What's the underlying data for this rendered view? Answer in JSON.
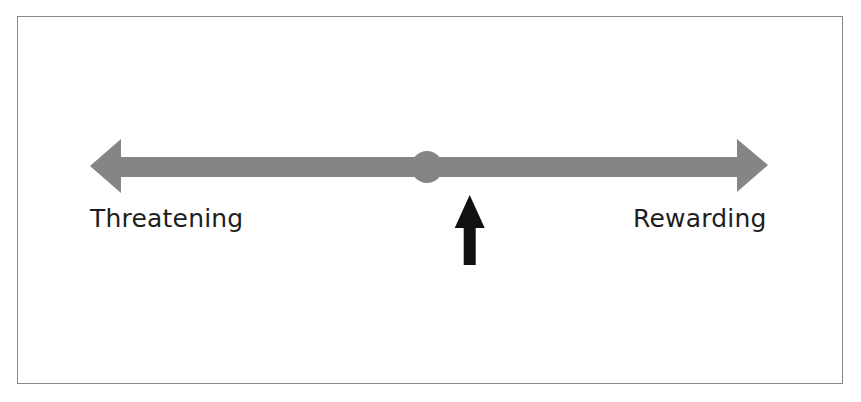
{
  "diagram": {
    "type": "bipolar-scale",
    "scale": {
      "left_label": "Threatening",
      "right_label": "Rewarding",
      "midpoint_marker": "circle",
      "line_color": "#858585"
    },
    "indicator": {
      "icon": "up-arrow",
      "color": "#111111",
      "position_fraction": 0.56
    },
    "frame_color": "#8a8a8a"
  }
}
